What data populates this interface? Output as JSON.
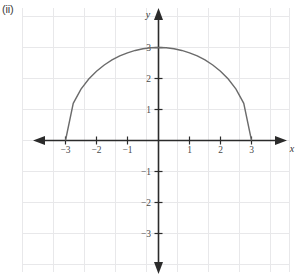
{
  "figure": {
    "part_label": "(ii)",
    "background_color": "#ffffff",
    "grid_color": "#e8e8ea",
    "axis_color": "#2b2b2b",
    "curve_color": "#6b6b6b",
    "tick_label_color": "#4a4a4a"
  },
  "axes": {
    "x_axis_name": "x",
    "y_axis_name": "y",
    "x_tick_labels": [
      "−3",
      "−2",
      "−1",
      "1",
      "2",
      "3"
    ],
    "x_tick_values": [
      -3,
      -2,
      -1,
      1,
      2,
      3
    ],
    "y_tick_labels": [
      "3",
      "2",
      "1",
      "−1",
      "−2",
      "−3"
    ],
    "y_tick_values": [
      3,
      2,
      1,
      -1,
      -2,
      -3
    ]
  },
  "chart_data": {
    "type": "line",
    "title": "",
    "subtitle": "",
    "xlabel": "x",
    "ylabel": "y",
    "xlim": [
      -4.4,
      4.3
    ],
    "ylim": [
      -4.3,
      4.2
    ],
    "grid": true,
    "grid_spacing": 1,
    "legend": "none",
    "annotations": [
      "(ii)"
    ],
    "series": [
      {
        "name": "upper semicircle radius 3",
        "equation": "y = sqrt(9 - x^2)",
        "domain": [
          -3,
          3
        ],
        "radius": 3,
        "center": [
          0,
          0
        ],
        "x": [
          -3,
          -2.75,
          -2.5,
          -2.25,
          -2,
          -1.75,
          -1.5,
          -1.25,
          -1,
          -0.75,
          -0.5,
          -0.25,
          0,
          0.25,
          0.5,
          0.75,
          1,
          1.25,
          1.5,
          1.75,
          2,
          2.25,
          2.5,
          2.75,
          3
        ],
        "values": [
          0,
          1.199,
          1.658,
          1.984,
          2.236,
          2.437,
          2.598,
          2.727,
          2.828,
          2.905,
          2.958,
          2.99,
          3,
          2.99,
          2.958,
          2.905,
          2.828,
          2.727,
          2.598,
          2.437,
          2.236,
          1.984,
          1.658,
          1.199,
          0
        ]
      }
    ],
    "x_tick_labels": [
      "−3",
      "−2",
      "−1",
      "1",
      "2",
      "3"
    ],
    "y_tick_labels": [
      "−3",
      "−2",
      "−1",
      "1",
      "2",
      "3"
    ]
  }
}
